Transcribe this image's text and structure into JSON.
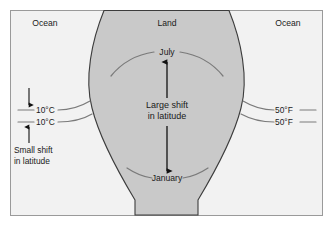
{
  "figure": {
    "frame": {
      "border_color": "#9a9a9a",
      "background_color": "#f2f2f2"
    },
    "land": {
      "label": "Land",
      "fill_color": "#c9c9c9",
      "outline_color": "#3c3c3c"
    },
    "ocean_left": {
      "label": "Ocean"
    },
    "ocean_right": {
      "label": "Ocean"
    },
    "isotherms": {
      "curve_color": "#7a7a7a",
      "left": [
        {
          "label": "10°C"
        },
        {
          "label": "10°C"
        }
      ],
      "right": [
        {
          "label": "50°F"
        },
        {
          "label": "50°F"
        }
      ]
    },
    "months": {
      "summer": "July",
      "winter": "January"
    },
    "annotations": {
      "large_shift_line1": "Large shift",
      "large_shift_line2": "in latitude",
      "small_shift_line1": "Small shift",
      "small_shift_line2": "in latitude"
    },
    "arrow_color": "#111111"
  }
}
